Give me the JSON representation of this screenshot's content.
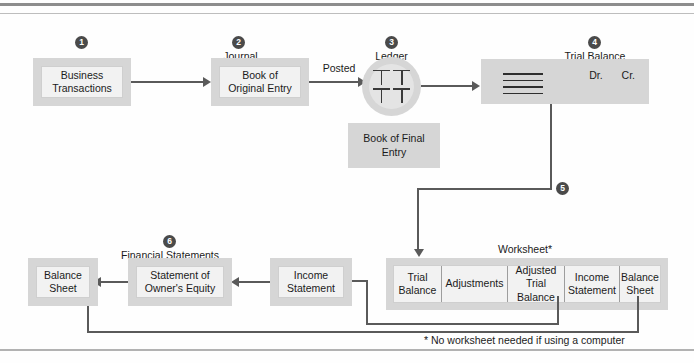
{
  "diagram": {
    "footnote": "* No worksheet needed if using a computer",
    "colors": {
      "frame": "#d6d6d6",
      "inner": "#f2f2f2",
      "connector": "#5a5a5a",
      "badge": "#4a4a4a"
    }
  },
  "steps": {
    "one": "1",
    "two": "2",
    "three": "3",
    "four": "4",
    "five": "5",
    "six": "6"
  },
  "captions": {
    "journal": "Journal",
    "ledger": "Ledger",
    "trial_balance": "Trial Balance",
    "worksheet": "Worksheet*",
    "financial_statements": "Financial Statements"
  },
  "nodes": {
    "business_transactions": "Business\nTransactions",
    "book_of_original_entry": "Book of\nOriginal Entry",
    "book_of_final_entry": "Book of Final\nEntry",
    "income_statement": "Income\nStatement",
    "statement_of_owners_equity": "Statement of\nOwner's Equity",
    "balance_sheet": "Balance\nSheet"
  },
  "edges": {
    "posted": "Posted"
  },
  "trial_balance": {
    "debit": "Dr.",
    "credit": "Cr.",
    "rule_count": 4
  },
  "worksheet_columns": [
    "Trial\nBalance",
    "Adjustments",
    "Adjusted\nTrial\nBalance",
    "Income\nStatement",
    "Balance\nSheet"
  ]
}
